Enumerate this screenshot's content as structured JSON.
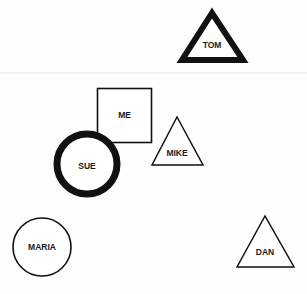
{
  "diagram": {
    "type": "sociogram",
    "divider": {
      "y": 73,
      "color": "#ececec"
    },
    "ink_color": "#111111",
    "nodes": [
      {
        "id": "tom",
        "label": "TOM",
        "shape": "triangle",
        "emphasis": "thick"
      },
      {
        "id": "me",
        "label": "ME",
        "shape": "square",
        "emphasis": "normal"
      },
      {
        "id": "sue",
        "label": "SUE",
        "shape": "circle",
        "emphasis": "thick"
      },
      {
        "id": "mike",
        "label": "MIKE",
        "shape": "triangle",
        "emphasis": "normal"
      },
      {
        "id": "maria",
        "label": "MARIA",
        "shape": "circle",
        "emphasis": "normal"
      },
      {
        "id": "dan",
        "label": "DAN",
        "shape": "triangle",
        "emphasis": "normal"
      }
    ]
  }
}
